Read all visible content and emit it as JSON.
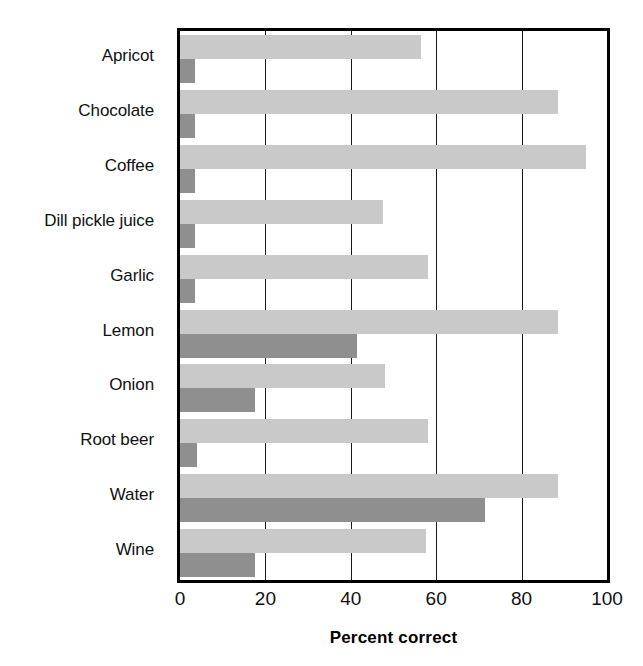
{
  "chart_data": {
    "type": "bar",
    "orientation": "horizontal",
    "title": "",
    "xlabel": "Percent correct",
    "ylabel": "",
    "xlim": [
      0,
      100
    ],
    "xticks": [
      0,
      20,
      40,
      60,
      80,
      100
    ],
    "xtick_labels": [
      "0",
      "20",
      "40",
      "60",
      "80",
      "100"
    ],
    "grid": true,
    "grid_axis": "x",
    "legend": null,
    "categories": [
      "Apricot",
      "Chocolate",
      "Coffee",
      "Dill pickle juice",
      "Garlic",
      "Lemon",
      "Onion",
      "Root beer",
      "Water",
      "Wine"
    ],
    "series": [
      {
        "name": "series-light",
        "color": "#c9c9c9",
        "values": [
          56.5,
          88.5,
          95.0,
          47.5,
          58.0,
          88.5,
          48.0,
          58.0,
          88.5,
          57.5
        ]
      },
      {
        "name": "series-dark",
        "color": "#8f8f8f",
        "values": [
          3.5,
          3.5,
          3.5,
          3.5,
          3.5,
          41.5,
          17.5,
          4.0,
          71.5,
          17.5
        ]
      }
    ]
  },
  "axis": {
    "x_title": "Percent correct"
  }
}
